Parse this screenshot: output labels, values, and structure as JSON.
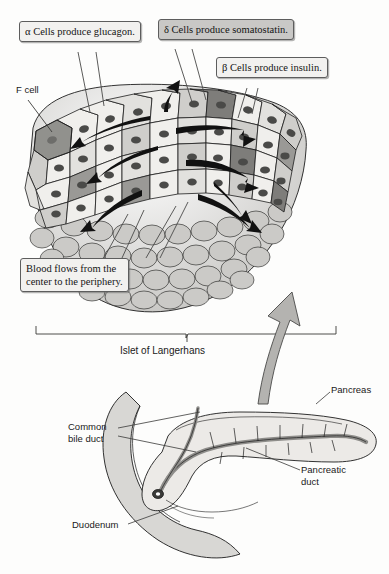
{
  "figure": {
    "title_caption": "Islet of Langerhans",
    "callouts": [
      {
        "id": "alpha",
        "text": "α Cells produce glucagon.",
        "shaded": false
      },
      {
        "id": "delta",
        "text": "δ Cells produce somatostatin.",
        "shaded": true
      },
      {
        "id": "beta",
        "text": "β Cells produce insulin.",
        "shaded": false
      },
      {
        "id": "blood",
        "line1": "Blood flows from the",
        "line2": "center to the periphery.",
        "shaded": false
      }
    ],
    "leader_labels": [
      {
        "id": "f-cell",
        "line1": "F cell",
        "line2": ""
      },
      {
        "id": "pancreas",
        "line1": "Pancreas",
        "line2": ""
      },
      {
        "id": "common-bile-duct",
        "line1": "Common",
        "line2": "bile duct"
      },
      {
        "id": "pancreatic-duct",
        "line1": "Pancreatic",
        "line2": "duct"
      },
      {
        "id": "duodenum",
        "line1": "Duodenum",
        "line2": ""
      }
    ],
    "colors": {
      "outline": "#1d1d1d",
      "cell_light": "#f0efec",
      "cell_mid": "#cfcecb",
      "cell_dark": "#9a9996",
      "cell_darker": "#7e7d7a",
      "nucleus": "#4a4a48",
      "organ_fill": "#d8d7d4",
      "organ_light": "#eceae7",
      "duct_fill": "#b9b8b5",
      "arrow_fill": "#b4b3b0",
      "paper": "#fdfdfc"
    }
  },
  "ghost_text": {
    "line_a": "",
    "line_b": ""
  }
}
